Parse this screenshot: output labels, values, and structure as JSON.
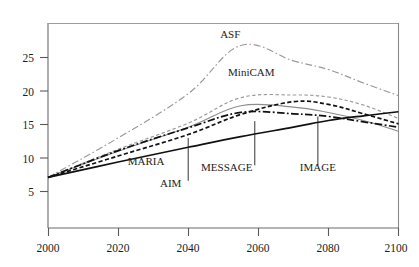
{
  "chart_data": {
    "type": "line",
    "title": "Gigatons of carbon",
    "xlabel": "",
    "ylabel": "Gigatons of carbon",
    "xlim": [
      2000,
      2100
    ],
    "ylim": [
      0,
      28.5
    ],
    "x_ticks": [
      2000,
      2020,
      2040,
      2060,
      2080,
      2100
    ],
    "y_ticks": [
      5,
      10,
      15,
      20,
      25
    ],
    "grid": false,
    "legend": "inline-annotations",
    "x": [
      2000,
      2020,
      2040,
      2055,
      2070,
      2080,
      2090,
      2100
    ],
    "series": [
      {
        "name": "ASF",
        "style": "dash-dot",
        "color": "#9a9a9a",
        "values": [
          7.1,
          13.0,
          19.6,
          26.8,
          24.5,
          23.2,
          21.2,
          19.3
        ]
      },
      {
        "name": "MiniCAM",
        "style": "dashed",
        "color": "#9a9a9a",
        "values": [
          7.1,
          11.3,
          15.2,
          19.0,
          19.4,
          19.1,
          17.9,
          15.9
        ]
      },
      {
        "name": "MESSAGE",
        "style": "solid-gray",
        "color": "#8d8d8d",
        "values": [
          7.1,
          11.0,
          14.6,
          17.8,
          17.6,
          16.8,
          15.6,
          14.0
        ]
      },
      {
        "name": "AIM",
        "style": "dashed-black",
        "color": "#111111",
        "values": [
          7.1,
          10.3,
          13.5,
          16.5,
          18.4,
          18.0,
          16.6,
          15.1
        ]
      },
      {
        "name": "IMAGE",
        "style": "dash-dot-black",
        "color": "#111111",
        "values": [
          7.1,
          11.1,
          14.5,
          16.8,
          16.6,
          16.2,
          15.4,
          14.6
        ]
      },
      {
        "name": "MARIA",
        "style": "solid-black",
        "color": "#111111",
        "values": [
          7.1,
          9.4,
          11.6,
          13.2,
          14.6,
          15.6,
          16.3,
          16.9
        ]
      }
    ],
    "annotations": [
      {
        "label": "ASF",
        "x": 2052,
        "y": 27.9,
        "leader": false
      },
      {
        "label": "MiniCAM",
        "x": 2058,
        "y": 22.3,
        "leader": false
      },
      {
        "label": "MARIA",
        "x": 2028,
        "y": 8.9,
        "leader": false
      },
      {
        "label": "AIM",
        "x": 2035,
        "y": 5.6,
        "leader": true,
        "leader_x": 2040,
        "leader_top": 13.0,
        "leader_bottom": 6.6
      },
      {
        "label": "MESSAGE",
        "x": 2051,
        "y": 8.0,
        "leader": true,
        "leader_x": 2059,
        "leader_top": 15.5,
        "leader_bottom": 8.9
      },
      {
        "label": "IMAGE",
        "x": 2077,
        "y": 8.0,
        "leader": true,
        "leader_x": 2077,
        "leader_top": 16.2,
        "leader_bottom": 8.9
      }
    ]
  },
  "colors": {
    "axis": "#5a5a5a",
    "text": "#1d1d1d",
    "gray_series": "#9a9a9a",
    "black_series": "#111111",
    "background": "#ffffff"
  }
}
